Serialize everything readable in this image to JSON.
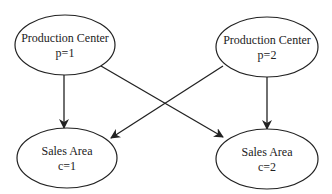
{
  "diagram": {
    "nodes": [
      {
        "id": "p1",
        "title": "Production Center",
        "label": "p=1"
      },
      {
        "id": "p2",
        "title": "Production Center",
        "label": "p=2"
      },
      {
        "id": "c1",
        "title": "Sales Area",
        "label": "c=1"
      },
      {
        "id": "c2",
        "title": "Sales Area",
        "label": "c=2"
      }
    ],
    "edges": [
      {
        "from": "p1",
        "to": "c1"
      },
      {
        "from": "p1",
        "to": "c2"
      },
      {
        "from": "p2",
        "to": "c1"
      },
      {
        "from": "p2",
        "to": "c2"
      }
    ],
    "colors": {
      "stroke": "#222222",
      "background": "#ffffff"
    }
  }
}
